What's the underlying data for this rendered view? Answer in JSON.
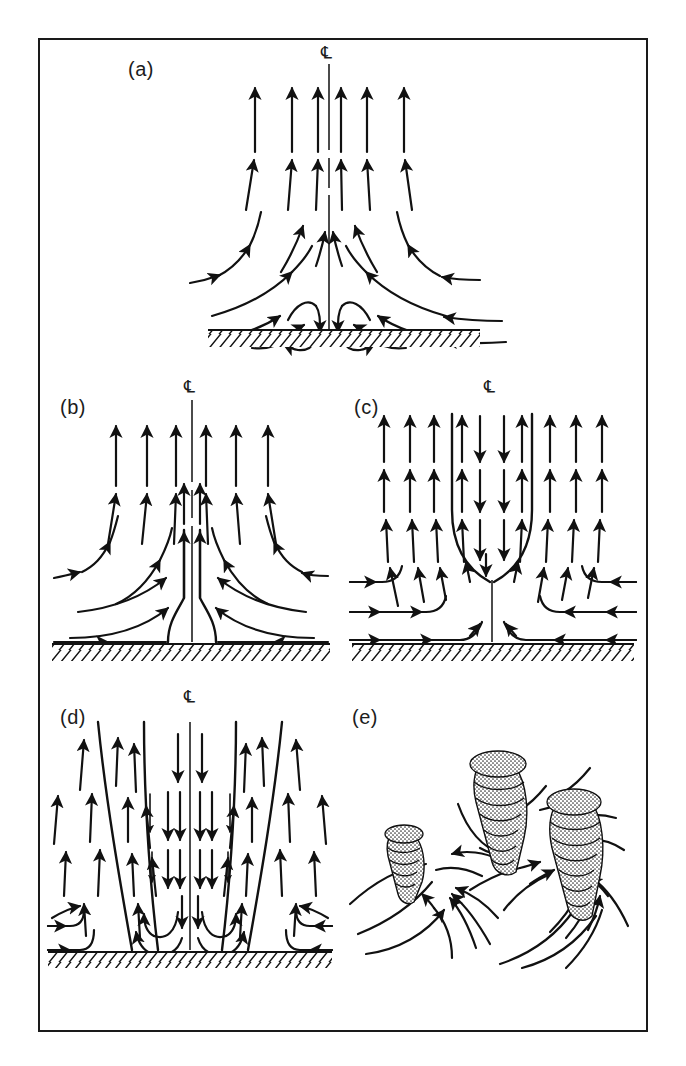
{
  "figure": {
    "kind": "line-diagram",
    "border_color": "#1a1a1a",
    "ink_color": "#111111",
    "background_color": "#ffffff"
  },
  "panels": [
    {
      "id": "a",
      "label": "(a)",
      "centerline_symbol": "℄",
      "caption_text": "",
      "description": "One-cell vortex with weak central downdraft near surface; streamlines converge inward and turn upward.",
      "has_ground_hatching": true,
      "has_centerline": true
    },
    {
      "id": "b",
      "label": "(b)",
      "centerline_symbol": "℄",
      "caption_text": "",
      "description": "Single-celled vortex; inflow turns sharply upward into a narrow axial updraft core.",
      "has_ground_hatching": true,
      "has_centerline": true
    },
    {
      "id": "c",
      "label": "(c)",
      "centerline_symbol": "℄",
      "caption_text": "",
      "description": "Two-celled vortex with central downdraft impinging on a stagnation point above the surface.",
      "has_ground_hatching": true,
      "has_centerline": true
    },
    {
      "id": "d",
      "label": "(d)",
      "centerline_symbol": "℄",
      "caption_text": "",
      "description": "Broad central downdraft with two annular updraft sheets and low-level return rolls.",
      "has_ground_hatching": true,
      "has_centerline": true
    },
    {
      "id": "e",
      "label": "(e)",
      "centerline_symbol": "",
      "caption_text": "",
      "description": "Multiple-vortex stage: three stippled suction funnels with spiralling inflow streamlines.",
      "has_ground_hatching": false,
      "has_centerline": false,
      "funnel_count": 3
    }
  ],
  "legend": {
    "centerline_label": "℄",
    "centerline_name": "centerline"
  }
}
